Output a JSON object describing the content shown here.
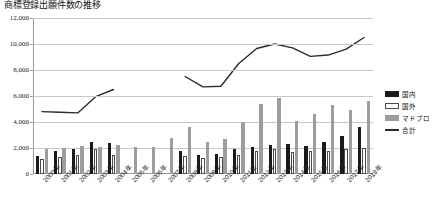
{
  "title": "商標登録出願件数の推移",
  "legend": {
    "items": [
      {
        "label": "国内",
        "key": "black"
      },
      {
        "label": "国外",
        "key": "white"
      },
      {
        "label": "マドプロ",
        "key": "gray"
      },
      {
        "label": "合計",
        "key": "line"
      }
    ]
  },
  "axis": {
    "y_ticks": [
      "0",
      "2,000",
      "4,000",
      "6,000",
      "8,000",
      "10,000",
      "12,000"
    ]
  },
  "chart_data": {
    "type": "bar",
    "title": "商標登録出願件数の推移",
    "xlabel": "",
    "ylabel": "",
    "ylim": [
      0,
      12000
    ],
    "ystep": 2000,
    "grid": true,
    "legend_position": "right",
    "categories": [
      "2000年",
      "2001年",
      "2002年",
      "2003年",
      "2004年",
      "2005年",
      "2006年",
      "2007年",
      "2008年",
      "2009年",
      "2010年",
      "2011年",
      "2012年",
      "2013年",
      "2014年",
      "2015年",
      "2016年",
      "2017年",
      "2018年"
    ],
    "series": [
      {
        "name": "国内",
        "type": "bar",
        "color": "#1a1a1a",
        "values": [
          1400,
          1750,
          1900,
          2500,
          2350,
          null,
          null,
          null,
          1750,
          1500,
          1550,
          1900,
          2100,
          2200,
          2300,
          2150,
          2450,
          2900,
          3600
        ]
      },
      {
        "name": "国外",
        "type": "bar",
        "color": "#ffffff",
        "values": [
          1150,
          1300,
          1450,
          1900,
          1500,
          null,
          null,
          null,
          1350,
          1250,
          1300,
          1500,
          1750,
          1900,
          1700,
          1750,
          1800,
          1900,
          2000
        ]
      },
      {
        "name": "マドプロ",
        "type": "bar",
        "color": "#9d9d9d",
        "values": [
          1900,
          2000,
          2150,
          2100,
          2200,
          2050,
          2050,
          2750,
          3650,
          2450,
          2700,
          4000,
          5400,
          5850,
          4100,
          4600,
          5300,
          4900,
          5600
        ]
      },
      {
        "name": "合計",
        "type": "line",
        "color": "#2b2b2b",
        "values": [
          4800,
          4750,
          4700,
          5950,
          6500,
          null,
          null,
          null,
          7500,
          6700,
          6750,
          8500,
          9650,
          10000,
          9700,
          9050,
          9150,
          9600,
          10500
        ]
      }
    ]
  }
}
